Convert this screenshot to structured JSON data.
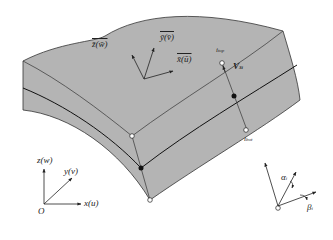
{
  "figure": {
    "type": "shell element geometry diagram",
    "colors": {
      "surface_fill": "#b4b4b4",
      "edge_stroke": "#333333",
      "mid_surface_stroke": "#111111",
      "background": "#ffffff"
    },
    "local_axes": {
      "z_label": "z̄(w̄)",
      "y_label": "ȳ(v̄)",
      "x_label": "x̄(ū)"
    },
    "director": {
      "top_node_label": "i",
      "top_node_sub": "top",
      "bottom_node_label": "i",
      "bottom_node_sub": "bot",
      "vector_label": "V",
      "vector_sub": "3i"
    },
    "global_axes": {
      "origin_label": "O",
      "z_label": "z(w)",
      "y_label": "y(v)",
      "x_label": "x(u)"
    },
    "rotations": {
      "alpha_label": "α",
      "alpha_sub": "i",
      "beta_label": "β",
      "beta_sub": "i"
    }
  }
}
